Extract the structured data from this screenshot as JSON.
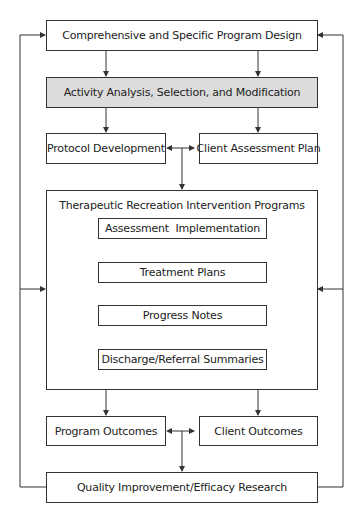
{
  "diagram": {
    "nodes": {
      "program_design": "Comprehensive and Specific Program Design",
      "activity_analysis": "Activity Analysis, Selection, and Modification",
      "protocol_development": "Protocol Development",
      "client_assessment_plan": "Client Assessment Plan",
      "intervention_programs": "Therapeutic Recreation Intervention Programs",
      "assessment_implementation": "Assessment  Implementation",
      "treatment_plans": "Treatment Plans",
      "progress_notes": "Progress Notes",
      "discharge_summaries": "Discharge/Referral Summaries",
      "program_outcomes": "Program Outcomes",
      "client_outcomes": "Client Outcomes",
      "quality_improvement": "Quality Improvement/Efficacy Research"
    },
    "colors": {
      "line": "#333333",
      "highlight_fill": "#dcdcdc"
    }
  }
}
